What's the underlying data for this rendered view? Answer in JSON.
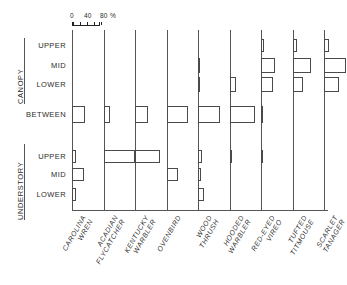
{
  "figure": {
    "scale": {
      "unit_label": "%",
      "tick_labels": [
        "0",
        "40",
        "80"
      ],
      "tick_values": [
        0,
        20,
        40,
        60,
        80
      ],
      "axis_min": 0,
      "axis_max": 80
    },
    "group_labels": [
      "CANOPY",
      "UNDERSTORY"
    ],
    "row_labels": [
      "UPPER",
      "MID",
      "LOWER",
      "BETWEEN",
      "UPPER",
      "MID",
      "LOWER"
    ],
    "colors": {
      "bar_outline": "#4a4a4a",
      "bar_fill": "#ffffff",
      "axis": "#555555",
      "text": "#2b2b2b"
    }
  },
  "chart_data": {
    "type": "bar",
    "orientation": "horizontal-grouped-by-species",
    "title": "",
    "xlabel": "%",
    "ylabel": "",
    "xlim": [
      0,
      100
    ],
    "grid": false,
    "legend": "none",
    "categories": [
      "CANOPY UPPER",
      "CANOPY MID",
      "CANOPY LOWER",
      "BETWEEN",
      "UNDERSTORY UPPER",
      "UNDERSTORY MID",
      "UNDERSTORY LOWER"
    ],
    "series": [
      {
        "name": "CAROLINA WREN",
        "name_lines": [
          "CAROLINA",
          "WREN"
        ],
        "values": [
          0,
          0,
          0,
          38,
          12,
          33,
          12
        ]
      },
      {
        "name": "ACADIAN FLYCATCHER",
        "name_lines": [
          "ACADIAN",
          "FLYCATCHER"
        ],
        "values": [
          0,
          0,
          0,
          18,
          90,
          0,
          0
        ]
      },
      {
        "name": "KENTUCKY WARBLER",
        "name_lines": [
          "KENTUCKY",
          "WARBLER"
        ],
        "values": [
          0,
          0,
          0,
          38,
          70,
          0,
          0
        ]
      },
      {
        "name": "OVENBIRD",
        "name_lines": [
          "OVENBIRD",
          ""
        ],
        "values": [
          0,
          0,
          0,
          62,
          0,
          34,
          0
        ]
      },
      {
        "name": "WOOD THRUSH",
        "name_lines": [
          "WOOD",
          "THRUSH"
        ],
        "values": [
          0,
          4,
          4,
          62,
          12,
          9,
          18
        ]
      },
      {
        "name": "HOODED WARBLER",
        "name_lines": [
          "HOODED",
          "WARBLER"
        ],
        "values": [
          0,
          0,
          18,
          73,
          6,
          0,
          0
        ]
      },
      {
        "name": "RED-EYED VIREO",
        "name_lines": [
          "RED-EYED",
          "VIREO"
        ],
        "values": [
          9,
          40,
          35,
          7,
          6,
          0,
          0
        ]
      },
      {
        "name": "TUFTED TITMOUSE",
        "name_lines": [
          "TUFTED",
          "TITMOUSE"
        ],
        "values": [
          14,
          54,
          30,
          0,
          0,
          0,
          0
        ]
      },
      {
        "name": "SCARLET TANAGER",
        "name_lines": [
          "SCARLET",
          "TANAGER"
        ],
        "values": [
          14,
          62,
          42,
          0,
          0,
          0,
          0
        ]
      }
    ]
  }
}
